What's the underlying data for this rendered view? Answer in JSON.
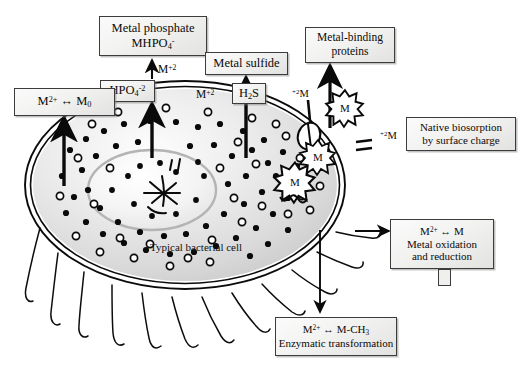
{
  "figure": {
    "subject": "Typical bacterial cell",
    "cell_label": "Typical bacterial cell"
  },
  "boxes": {
    "metal_phosphate": {
      "line1": "Metal phosphate",
      "line2_html": "MHPO",
      "line2_sub": "4",
      "line2_sup": "-"
    },
    "hpo4": {
      "text": "HPO",
      "sub": "4",
      "sup": "-2"
    },
    "metal_sulfide": {
      "label": "Metal sulfide"
    },
    "h2s": {
      "text": "H",
      "sub": "2",
      "tail": "S"
    },
    "metal_zero": {
      "text": "M",
      "sup": "2+",
      "arrow": "↔",
      "tail": "M",
      "tail_sub": "0"
    },
    "metal_binding_proteins": {
      "line1": "Metal-binding",
      "line2": "proteins"
    },
    "native_biosorption": {
      "line1": "Native biosorption",
      "line2": "by surface charge"
    },
    "metal_oxidation": {
      "line1": "M",
      "line1_sup": "2+",
      "line1_arrow": "↔",
      "line1_tail": "M",
      "line2": "Metal oxidation",
      "line3": "and reduction"
    },
    "enzymatic": {
      "line1": "M",
      "line1_sup": "2+",
      "line1_arrow": "↔",
      "line1_tail": "M-CH",
      "line1_tail_sub": "3",
      "line2": "Enzymatic transformation"
    }
  },
  "flux_labels": {
    "phosphate_influx": {
      "text": "M",
      "sup": "+2"
    },
    "sulfide_influx": {
      "text": "M",
      "sup": "+2"
    },
    "pore_influx": {
      "sup": "+2",
      "text": "M"
    },
    "surface_bound": {
      "sup": "+2",
      "text": "M"
    }
  },
  "metal_glyphs": {
    "free_outside": "M",
    "membrane_bound": "M",
    "internal": "M"
  },
  "colors": {
    "box_border": "#3c3c3c",
    "box_fill": "#f2f2f1",
    "ink": "#0a0a0a",
    "cytoplasm": "#dedede",
    "nucleoid": "#f2f2f2",
    "background": "#ffffff"
  }
}
